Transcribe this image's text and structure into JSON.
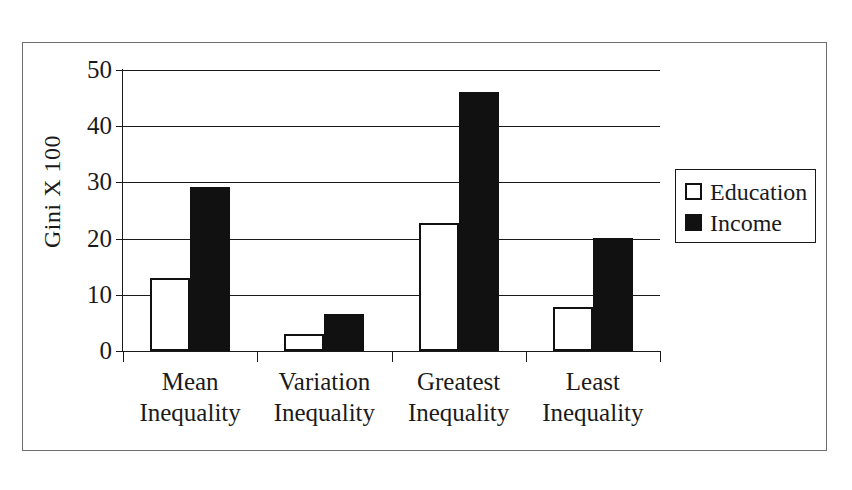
{
  "chart_data": {
    "type": "bar",
    "title": "",
    "xlabel": "",
    "ylabel": "Gini X 100",
    "ylim": [
      0,
      50
    ],
    "ytick_values": [
      50,
      40,
      30,
      20,
      10,
      0
    ],
    "ytick_labels": [
      "50",
      "40",
      "30",
      "20",
      "10",
      "0"
    ],
    "grid": true,
    "legend_position": "right",
    "categories": [
      "Mean\nInequality",
      "Variation\nInequality",
      "Greatest\nInequality",
      "Least\nInequality"
    ],
    "category_lines": [
      [
        "Mean",
        "Inequality"
      ],
      [
        "Variation",
        "Inequality"
      ],
      [
        "Greatest",
        "Inequality"
      ],
      [
        "Least",
        "Inequality"
      ]
    ],
    "series": [
      {
        "name": "Education",
        "color": "#ffffff",
        "edge_color": "#111111",
        "values": [
          13.0,
          3.1,
          22.7,
          7.8
        ]
      },
      {
        "name": "Income",
        "color": "#111111",
        "edge_color": "#111111",
        "values": [
          29.2,
          6.6,
          46.0,
          20.1
        ]
      }
    ]
  },
  "legend": {
    "items": [
      {
        "label": "Education",
        "swatch": "hollow-square"
      },
      {
        "label": "Income",
        "swatch": "filled-square"
      }
    ]
  },
  "colors": {
    "axis": "#1a1a1a",
    "grid": "#1a1a1a",
    "frame": "#6e6e6e",
    "background": "#ffffff"
  }
}
